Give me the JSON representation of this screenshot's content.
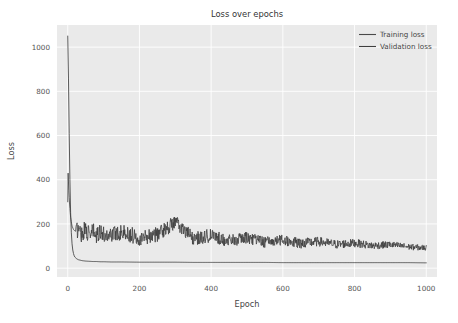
{
  "chart_data": {
    "type": "line",
    "title": "Loss over epochs",
    "xlabel": "Epoch",
    "ylabel": "Loss",
    "xlim": [
      -30,
      1030
    ],
    "ylim": [
      -40,
      1100
    ],
    "grid": true,
    "legend_position": "upper right",
    "xticks": [
      "0",
      "200",
      "400",
      "600",
      "800",
      "1000"
    ],
    "xtick_values": [
      0,
      200,
      400,
      600,
      800,
      1000
    ],
    "yticks": [
      "0",
      "200",
      "400",
      "600",
      "800",
      "1000"
    ],
    "ytick_values": [
      0,
      200,
      400,
      600,
      800,
      1000
    ],
    "series": [
      {
        "name": "Training loss",
        "color": "#4a4a4a",
        "linewidth": 0.9,
        "description": "Starts at ~1050 at epoch 0, drops almost vertically within the first ~15 epochs, then flattens near 25 for the remainder.",
        "x": [
          0,
          2,
          4,
          6,
          8,
          10,
          12,
          14,
          16,
          18,
          20,
          25,
          30,
          40,
          50,
          60,
          70,
          80,
          90,
          100,
          120,
          150,
          200,
          250,
          300,
          350,
          400,
          450,
          500,
          550,
          600,
          650,
          700,
          750,
          800,
          850,
          900,
          950,
          1000
        ],
        "values": [
          1050,
          860,
          610,
          400,
          250,
          160,
          110,
          82,
          66,
          56,
          50,
          42,
          38,
          34,
          32,
          31,
          30,
          30,
          29,
          29,
          28,
          28,
          27,
          27,
          27,
          26,
          26,
          26,
          26,
          26,
          25,
          25,
          25,
          25,
          25,
          25,
          25,
          25,
          24
        ]
      },
      {
        "name": "Validation loss",
        "color": "#3f3f3f",
        "linewidth": 0.8,
        "description": "Spikes to ~430 at epoch ~1, collapses to the 100-200 band by epoch ~25, then oscillates noisily with mean drifting from ~150 down to ~90 at epoch 1000; one outlier peak of ~205 near epoch 300.",
        "x": [
          0,
          1,
          3,
          5,
          8,
          12,
          16,
          20,
          25,
          30,
          40,
          50,
          60,
          70,
          80,
          90,
          100,
          150,
          200,
          250,
          300,
          350,
          400,
          450,
          500,
          550,
          600,
          650,
          700,
          750,
          800,
          850,
          900,
          950,
          1000
        ],
        "values": [
          300,
          430,
          350,
          290,
          230,
          190,
          175,
          168,
          165,
          175,
          150,
          180,
          140,
          165,
          135,
          170,
          145,
          160,
          135,
          150,
          205,
          130,
          145,
          120,
          135,
          115,
          125,
          110,
          118,
          105,
          112,
          100,
          105,
          95,
          90
        ],
        "noise_band_start": [
          90,
          205
        ],
        "noise_band_end": [
          72,
          108
        ]
      }
    ]
  },
  "figure": {
    "facecolor": "#ffffff",
    "axes_facecolor": "#eaeaea",
    "grid_color": "#ffffff",
    "tick_color": "#555555"
  }
}
